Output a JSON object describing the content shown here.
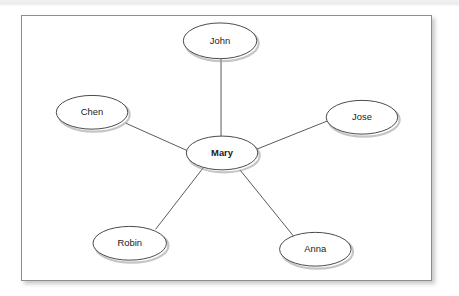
{
  "frame": {
    "border_color": "#8d8d8d",
    "background": "#ffffff"
  },
  "top_strip": {
    "color": "#ebebeb"
  },
  "chart_data": {
    "type": "diagram",
    "layout": "star",
    "title": "",
    "center_node": "Mary",
    "nodes": [
      {
        "id": "mary",
        "label": "Mary",
        "cx": 201,
        "cy": 138,
        "rx": 36,
        "ry": 17,
        "bold": true
      },
      {
        "id": "john",
        "label": "John",
        "cx": 199,
        "cy": 25,
        "rx": 37,
        "ry": 18,
        "bold": false
      },
      {
        "id": "chen",
        "label": "Chen",
        "cx": 70,
        "cy": 97,
        "rx": 36,
        "ry": 17,
        "bold": false
      },
      {
        "id": "jose",
        "label": "Jose",
        "cx": 342,
        "cy": 102,
        "rx": 36,
        "ry": 17,
        "bold": false
      },
      {
        "id": "robin",
        "label": "Robin",
        "cx": 108,
        "cy": 229,
        "rx": 37,
        "ry": 17,
        "bold": false
      },
      {
        "id": "anna",
        "label": "Anna",
        "cx": 295,
        "cy": 235,
        "rx": 36,
        "ry": 17,
        "bold": false
      }
    ],
    "edges": [
      {
        "id": "mary-john",
        "source": "mary",
        "target": "john",
        "x1": 200,
        "y1": 121,
        "x2": 200,
        "y2": 43
      },
      {
        "id": "mary-chen",
        "source": "mary",
        "target": "chen",
        "x1": 169,
        "y1": 137,
        "x2": 104,
        "y2": 108
      },
      {
        "id": "mary-jose",
        "source": "mary",
        "target": "jose",
        "x1": 234,
        "y1": 135,
        "x2": 309,
        "y2": 105
      },
      {
        "id": "mary-robin",
        "source": "mary",
        "target": "robin",
        "x1": 182,
        "y1": 153,
        "x2": 134,
        "y2": 215
      },
      {
        "id": "mary-anna",
        "source": "mary",
        "target": "anna",
        "x1": 219,
        "y1": 155,
        "x2": 274,
        "y2": 223
      }
    ],
    "node_count": 6,
    "edge_count": 5,
    "node_fill": "#ffffff",
    "node_stroke": "#4a4a4a",
    "edge_stroke": "#5a5a5a"
  }
}
